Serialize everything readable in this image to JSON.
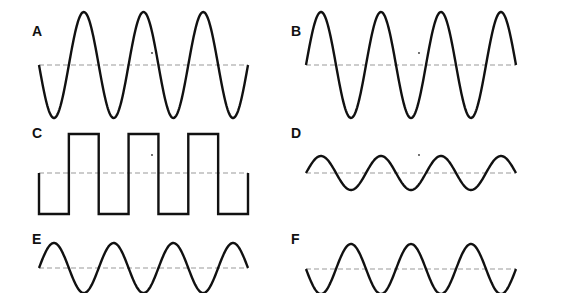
{
  "figure": {
    "colors": {
      "wave": "#111111",
      "baseline": "#999999",
      "background": "#ffffff"
    }
  },
  "panels": [
    {
      "label": "A",
      "type": "sine",
      "phase": "starts at baseline going down",
      "cycles": 3.5,
      "amplitude": "large",
      "x0": 39,
      "x1": 248,
      "mid": 65,
      "amp": 53,
      "sign": -1,
      "label_x": 32,
      "label_y": 24
    },
    {
      "label": "B",
      "type": "sine",
      "phase": "starts at baseline going up",
      "cycles": 3.5,
      "amplitude": "large",
      "x0": 306,
      "x1": 516,
      "mid": 65,
      "amp": 53,
      "sign": 1,
      "label_x": 291,
      "label_y": 24
    },
    {
      "label": "C",
      "type": "square",
      "phase": "starts at baseline going down",
      "cycles": 3.5,
      "amplitude": "medium",
      "x0": 39,
      "x1": 248,
      "mid": 173,
      "high": 134,
      "low": 214,
      "label_x": 32,
      "label_y": 126
    },
    {
      "label": "D",
      "type": "sine",
      "phase": "starts at baseline going up",
      "cycles": 3.5,
      "amplitude": "small",
      "x0": 306,
      "x1": 516,
      "mid": 173,
      "amp": 17,
      "sign": 1,
      "label_x": 291,
      "label_y": 126
    },
    {
      "label": "E",
      "type": "sine",
      "phase": "starts at baseline going up",
      "cycles": 3.5,
      "amplitude": "medium",
      "x0": 39,
      "x1": 248,
      "mid": 268,
      "amp": 25,
      "sign": 1,
      "label_x": 32,
      "label_y": 232
    },
    {
      "label": "F",
      "type": "sine",
      "phase": "starts at baseline going down",
      "cycles": 3.5,
      "amplitude": "medium",
      "x0": 306,
      "x1": 516,
      "mid": 269,
      "amp": 25,
      "sign": -1,
      "label_x": 291,
      "label_y": 232
    }
  ],
  "markers": [
    {
      "x": 152,
      "y": 53
    },
    {
      "x": 419,
      "y": 53
    },
    {
      "x": 152,
      "y": 155
    },
    {
      "x": 419,
      "y": 155
    }
  ]
}
